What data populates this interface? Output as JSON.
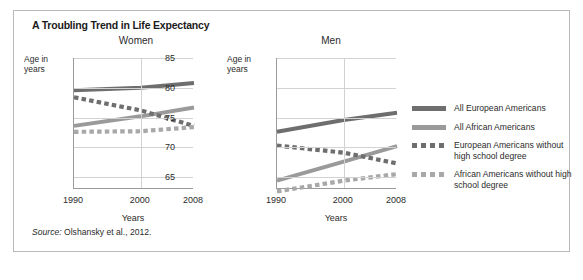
{
  "figure": {
    "title": "A Troubling Trend in Life Expectancy",
    "source_prefix": "Source:",
    "source_text": "Olshansky et al., 2012."
  },
  "colors": {
    "all_european": "#6e6e6e",
    "all_african": "#9a9a9a",
    "european_no_hs": "#6e6e6e",
    "african_no_hs": "#a8a8a8",
    "grid": "#d2d2d2",
    "axis": "#9a9a9a",
    "frame": "#b9b9b9",
    "text": "#2b2b2b"
  },
  "legend": {
    "position": "right",
    "items": [
      {
        "label": "All European Americans",
        "style": "solid",
        "color_key": "all_european"
      },
      {
        "label": "All African Americans",
        "style": "solid",
        "color_key": "all_african"
      },
      {
        "label": "European Americans without high school degree",
        "style": "dashed",
        "color_key": "european_no_hs"
      },
      {
        "label": "African Americans without high school degree",
        "style": "dashed",
        "color_key": "african_no_hs"
      }
    ]
  },
  "chart_data": [
    {
      "type": "line",
      "title": "Women",
      "xlabel": "Years",
      "ylabel": "Age in years",
      "x": [
        1990,
        2000,
        2008
      ],
      "xticks": [
        "1990",
        "2000",
        "2008"
      ],
      "xlim": [
        1990,
        2008
      ],
      "ylim": [
        63,
        85
      ],
      "yticks": [
        85,
        80,
        75,
        70,
        65
      ],
      "grid": true,
      "series": [
        {
          "name": "All European Americans",
          "style": "solid",
          "values": [
            79.6,
            80.0,
            80.8
          ]
        },
        {
          "name": "All African Americans",
          "style": "solid",
          "values": [
            73.6,
            75.2,
            76.7
          ]
        },
        {
          "name": "European Americans without high school degree",
          "style": "dashed",
          "values": [
            78.4,
            76.2,
            73.6
          ]
        },
        {
          "name": "African Americans without high school degree",
          "style": "dashed",
          "values": [
            72.6,
            72.7,
            73.4
          ]
        }
      ]
    },
    {
      "type": "line",
      "title": "Men",
      "xlabel": "Years",
      "ylabel": "Age in years",
      "x": [
        1990,
        2000,
        2008
      ],
      "xticks": [
        "1990",
        "2000",
        "2008"
      ],
      "xlim": [
        1990,
        2008
      ],
      "ylim": [
        63,
        85
      ],
      "yticks": [
        85,
        80,
        75,
        70,
        65
      ],
      "grid": true,
      "series": [
        {
          "name": "All European Americans",
          "style": "solid",
          "values": [
            72.6,
            74.6,
            75.8
          ]
        },
        {
          "name": "All African Americans",
          "style": "solid",
          "values": [
            64.4,
            67.6,
            70.2
          ]
        },
        {
          "name": "European Americans without high school degree",
          "style": "dashed",
          "values": [
            70.3,
            69.1,
            67.3
          ]
        },
        {
          "name": "African Americans without high school degree",
          "style": "dashed",
          "values": [
            62.6,
            64.4,
            65.5
          ]
        }
      ]
    }
  ]
}
